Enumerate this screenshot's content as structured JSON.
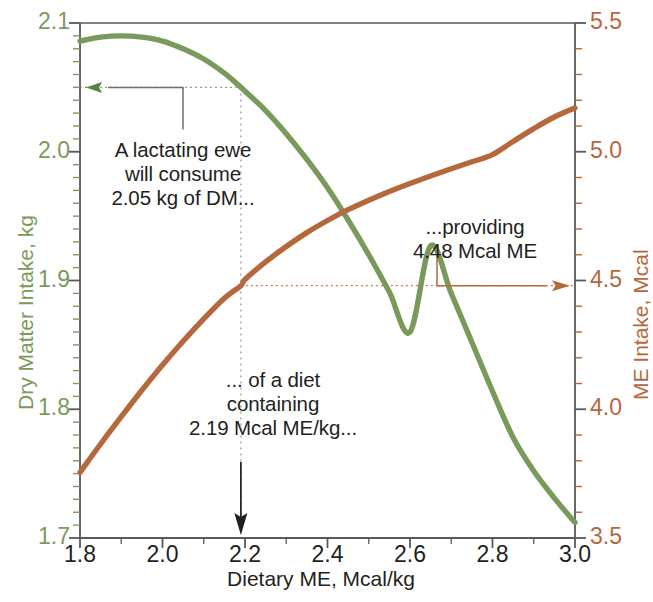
{
  "chart_data": {
    "type": "line",
    "title": "",
    "xlabel": "Dietary ME, Mcal/kg",
    "xlim": [
      1.8,
      3.0
    ],
    "xticks": [
      "1.8",
      "2.0",
      "2.2",
      "2.4",
      "2.6",
      "2.8",
      "3.0"
    ],
    "xtick_values": [
      1.8,
      2.0,
      2.2,
      2.4,
      2.6,
      2.8,
      3.0
    ],
    "x_minor_step": 0.1,
    "grid": false,
    "legend": "none",
    "axes": [
      {
        "id": "left",
        "label": "Dry Matter Intake, kg",
        "color": "#7a9a5b",
        "lim": [
          1.7,
          2.1
        ],
        "ticks": [
          "1.7",
          "1.8",
          "1.9",
          "2.0",
          "2.1"
        ],
        "tick_values": [
          1.7,
          1.8,
          1.9,
          2.0,
          2.1
        ],
        "minor_step": 0.01
      },
      {
        "id": "right",
        "label": "ME Intake, Mcal",
        "color": "#b5683c",
        "lim": [
          3.5,
          5.5
        ],
        "ticks": [
          "3.5",
          "4.0",
          "4.5",
          "5.0",
          "5.5"
        ],
        "tick_values": [
          3.5,
          4.0,
          4.5,
          5.0,
          5.5
        ],
        "minor_step": 0.1
      }
    ],
    "series": [
      {
        "name": "Dry Matter Intake",
        "axis": "left",
        "color": "#7a9a5b",
        "x": [
          1.8,
          1.85,
          1.9,
          1.95,
          2.0,
          2.05,
          2.1,
          2.15,
          2.19,
          2.2,
          2.25,
          2.3,
          2.35,
          2.4,
          2.45,
          2.5,
          2.55,
          2.6,
          2.65,
          2.7,
          2.75,
          2.8,
          2.85,
          2.9,
          2.95,
          3.0
        ],
        "values": [
          2.086,
          2.089,
          2.09,
          2.089,
          2.086,
          2.08,
          2.072,
          2.061,
          2.05,
          2.047,
          2.032,
          2.014,
          1.994,
          1.972,
          1.947,
          1.92,
          1.891,
          1.86,
          1.927,
          1.89,
          1.852,
          1.814,
          1.778,
          1.752,
          1.731,
          1.712
        ]
      },
      {
        "name": "ME Intake",
        "axis": "right",
        "color": "#b5683c",
        "x": [
          1.8,
          1.85,
          1.9,
          1.95,
          2.0,
          2.05,
          2.1,
          2.15,
          2.19,
          2.2,
          2.25,
          2.3,
          2.35,
          2.4,
          2.45,
          2.5,
          2.55,
          2.6,
          2.65,
          2.7,
          2.75,
          2.8,
          2.85,
          2.9,
          2.95,
          3.0
        ],
        "values": [
          3.755,
          3.865,
          3.971,
          4.074,
          4.172,
          4.264,
          4.351,
          4.431,
          4.48,
          4.504,
          4.572,
          4.632,
          4.686,
          4.733,
          4.775,
          4.812,
          4.846,
          4.877,
          4.906,
          4.934,
          4.961,
          4.989,
          5.04,
          5.09,
          5.135,
          5.17
        ]
      }
    ],
    "callouts": {
      "dmi_value": 2.05,
      "me_per_kg_value": 2.19,
      "me_intake_value": 4.48
    },
    "annotations": [
      {
        "id": "dmi-note",
        "text": "A lactating ewe\nwill consume\n2.05 kg of DM...",
        "color": "#231f20"
      },
      {
        "id": "diet-note",
        "text": "... of a diet\ncontaining\n2.19 Mcal ME/kg...",
        "color": "#231f20"
      },
      {
        "id": "me-note",
        "text": "...providing\n4.48 Mcal ME",
        "color": "#231f20"
      }
    ]
  }
}
